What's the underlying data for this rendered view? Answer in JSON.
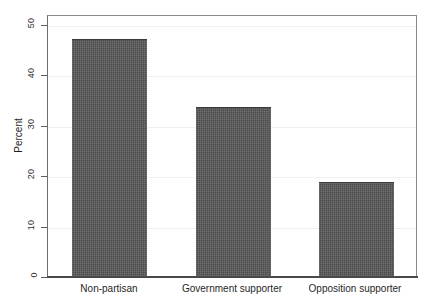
{
  "chart_data": {
    "type": "bar",
    "title": "",
    "subtitle": "",
    "xlabel": "",
    "ylabel": "Percent",
    "categories": [
      "Non-partisan",
      "Government supporter",
      "Opposition supporter"
    ],
    "values": [
      47.0,
      33.5,
      18.7
    ],
    "ylim": [
      0,
      52
    ],
    "yticks": [
      0,
      10,
      20,
      30,
      40,
      50
    ],
    "ytick_labels": [
      "0",
      "10",
      "20",
      "30",
      "40",
      "50"
    ],
    "grid": true,
    "legend": null,
    "legend_position": "none",
    "bar_color": "#4b4b4b",
    "frame_color": "#6f6f6f",
    "gridline_color": "#f0f0f0",
    "background": "#ffffff"
  }
}
